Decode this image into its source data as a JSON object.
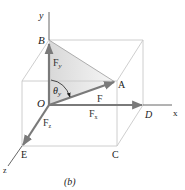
{
  "caption": "(b)",
  "axes": {
    "x": "x",
    "y": "y",
    "z": "z"
  },
  "points": {
    "O": "O",
    "A": "A",
    "B": "B",
    "C": "C",
    "D": "D",
    "E": "E"
  },
  "vectors": {
    "F": {
      "label": "F"
    },
    "Fx": {
      "label": "F",
      "sub": "x"
    },
    "Fy": {
      "label": "F",
      "sub": "y"
    },
    "Fz": {
      "label": "F",
      "sub": "z"
    }
  },
  "angle": {
    "label": "θ",
    "sub": "y"
  },
  "colors": {
    "vector": "#7a7a7a",
    "box_edge": "#c8c8c8",
    "axis": "#555555",
    "shade": "#e4e4e4"
  }
}
